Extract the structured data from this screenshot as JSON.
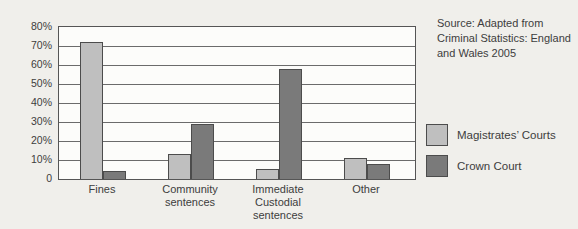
{
  "source_note": "Source: Adapted from\nCriminal Statistics: England\nand Wales 2005",
  "colors": {
    "magistrates_fill": "#bfbfbf",
    "crown_fill": "#7a7a7a",
    "bar_border": "#4c4c4c",
    "gridline": "#6b6b6b",
    "paper": "#f0efeb",
    "plot_background": "#fcfcfa",
    "text": "#3d3d3d"
  },
  "chart_data": {
    "type": "bar",
    "title": "",
    "xlabel": "",
    "ylabel": "",
    "categories": [
      "Fines",
      "Community\nsentences",
      "Immediate\nCustodial\nsentences",
      "Other"
    ],
    "series": [
      {
        "name": "Magistrates’ Courts",
        "color": "#bfbfbf",
        "values": [
          72,
          13,
          5,
          11
        ]
      },
      {
        "name": "Crown Court",
        "color": "#7a7a7a",
        "values": [
          4,
          29,
          58,
          8
        ]
      }
    ],
    "ylim": [
      0,
      80
    ],
    "yticks": [
      "80%",
      "70%",
      "60%",
      "50%",
      "40%",
      "30%",
      "20%",
      "10%",
      "0"
    ],
    "ytick_values": [
      80,
      70,
      60,
      50,
      40,
      30,
      20,
      10,
      0
    ],
    "grid": true,
    "legend_position": "right",
    "annotation": "Source: Adapted from Criminal Statistics: England and Wales 2005"
  }
}
